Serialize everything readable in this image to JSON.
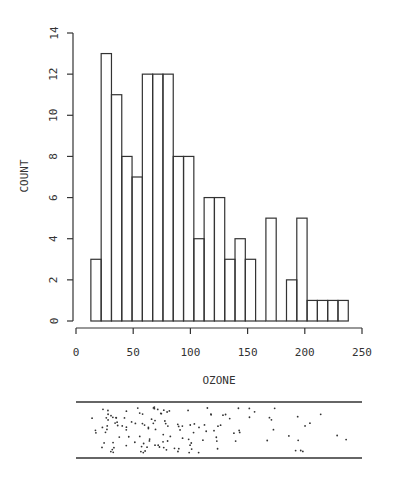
{
  "chart_data": {
    "type": "bar",
    "subtype": "histogram",
    "title": "",
    "xlabel": "OZONE",
    "ylabel": "COUNT",
    "xlim": [
      0,
      250
    ],
    "ylim": [
      0,
      14
    ],
    "xticks": [
      0,
      50,
      100,
      150,
      200,
      250
    ],
    "yticks": [
      0,
      2,
      4,
      6,
      8,
      10,
      12,
      14
    ],
    "bin_start": 13,
    "bin_width": 9,
    "bin_edges": [
      13,
      22,
      31,
      40,
      49,
      58,
      67,
      76,
      85,
      94,
      103,
      112,
      121,
      130,
      139,
      148,
      157,
      166,
      175,
      184,
      193,
      202,
      211,
      220,
      229,
      238
    ],
    "values": [
      3,
      13,
      11,
      8,
      7,
      12,
      12,
      12,
      8,
      8,
      4,
      6,
      6,
      3,
      4,
      3,
      0,
      5,
      0,
      2,
      5,
      1,
      1,
      1,
      1
    ],
    "grid": false,
    "legend": null,
    "strip_plot": {
      "description": "jittered dot strip plot of individual ozone values below the histogram",
      "xlim": [
        0,
        250
      ]
    }
  },
  "axis": {
    "x_tick_labels": [
      "0",
      "50",
      "100",
      "150",
      "200",
      "250"
    ],
    "y_tick_labels": [
      "0",
      "2",
      "4",
      "6",
      "8",
      "10",
      "12",
      "14"
    ]
  },
  "colors": {
    "stroke": "#333333",
    "background": "#ffffff"
  }
}
